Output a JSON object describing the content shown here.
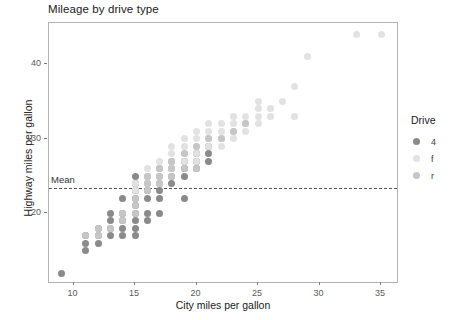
{
  "chart_data": {
    "type": "scatter",
    "title": "Mileage by drive type",
    "xlabel": "City miles per gallon",
    "ylabel": "Highway miles per gallon",
    "xlim": [
      8.0,
      36.3
    ],
    "ylim": [
      10.8,
      45.5
    ],
    "xticks": [
      10,
      15,
      20,
      25,
      30,
      35
    ],
    "yticks": [
      20,
      30,
      40
    ],
    "grid": false,
    "legend": {
      "title": "Drive",
      "position": "right",
      "entries": [
        {
          "label": "4",
          "color": "#8a8a8a"
        },
        {
          "label": "f",
          "color": "#e2e2e2"
        },
        {
          "label": "r",
          "color": "#c6c6c6"
        }
      ]
    },
    "annotations": [
      {
        "label": "Mean",
        "type": "hline",
        "y": 23.44,
        "style": "dashed",
        "color": "#555555"
      }
    ],
    "series": [
      {
        "name": "4",
        "color": "#8a8a8a",
        "points": [
          [
            9,
            12
          ],
          [
            11,
            15
          ],
          [
            11,
            16
          ],
          [
            11,
            17
          ],
          [
            12,
            16
          ],
          [
            12,
            17
          ],
          [
            12,
            18
          ],
          [
            13,
            17
          ],
          [
            13,
            18
          ],
          [
            13,
            19
          ],
          [
            13,
            20
          ],
          [
            14,
            17
          ],
          [
            14,
            18
          ],
          [
            14,
            19
          ],
          [
            14,
            20
          ],
          [
            14,
            22
          ],
          [
            15,
            17
          ],
          [
            15,
            18
          ],
          [
            15,
            19
          ],
          [
            15,
            20
          ],
          [
            15,
            21
          ],
          [
            15,
            22
          ],
          [
            15,
            23
          ],
          [
            15,
            24
          ],
          [
            15,
            25
          ],
          [
            16,
            19
          ],
          [
            16,
            20
          ],
          [
            16,
            22
          ],
          [
            16,
            23
          ],
          [
            16,
            24
          ],
          [
            16,
            25
          ],
          [
            17,
            20
          ],
          [
            17,
            22
          ],
          [
            17,
            23
          ],
          [
            17,
            24
          ],
          [
            17,
            25
          ],
          [
            17,
            26
          ],
          [
            18,
            24
          ],
          [
            18,
            25
          ],
          [
            18,
            26
          ],
          [
            18,
            27
          ],
          [
            19,
            22
          ],
          [
            19,
            25
          ],
          [
            19,
            26
          ],
          [
            19,
            27
          ],
          [
            20,
            26
          ],
          [
            20,
            27
          ],
          [
            20,
            28
          ],
          [
            21,
            27
          ],
          [
            21,
            28
          ],
          [
            21,
            29
          ]
        ]
      },
      {
        "name": "f",
        "color": "#e2e2e2",
        "points": [
          [
            15,
            23
          ],
          [
            15,
            24
          ],
          [
            16,
            24
          ],
          [
            16,
            25
          ],
          [
            16,
            26
          ],
          [
            17,
            24
          ],
          [
            17,
            25
          ],
          [
            17,
            26
          ],
          [
            17,
            27
          ],
          [
            18,
            26
          ],
          [
            18,
            27
          ],
          [
            18,
            28
          ],
          [
            18,
            29
          ],
          [
            19,
            27
          ],
          [
            19,
            28
          ],
          [
            19,
            29
          ],
          [
            19,
            30
          ],
          [
            20,
            27
          ],
          [
            20,
            28
          ],
          [
            20,
            29
          ],
          [
            20,
            30
          ],
          [
            20,
            31
          ],
          [
            21,
            29
          ],
          [
            21,
            30
          ],
          [
            21,
            31
          ],
          [
            21,
            32
          ],
          [
            22,
            29
          ],
          [
            22,
            30
          ],
          [
            22,
            31
          ],
          [
            22,
            32
          ],
          [
            23,
            30
          ],
          [
            23,
            31
          ],
          [
            23,
            32
          ],
          [
            23,
            33
          ],
          [
            24,
            31
          ],
          [
            24,
            32
          ],
          [
            24,
            33
          ],
          [
            25,
            32
          ],
          [
            25,
            33
          ],
          [
            25,
            34
          ],
          [
            25,
            35
          ],
          [
            26,
            33
          ],
          [
            26,
            34
          ],
          [
            27,
            35
          ],
          [
            28,
            33
          ],
          [
            28,
            37
          ],
          [
            29,
            41
          ],
          [
            33,
            44
          ],
          [
            35,
            44
          ]
        ]
      },
      {
        "name": "r",
        "color": "#c6c6c6",
        "points": [
          [
            11,
            17
          ],
          [
            12,
            17
          ],
          [
            12,
            18
          ],
          [
            13,
            18
          ],
          [
            14,
            19
          ],
          [
            14,
            20
          ],
          [
            15,
            20
          ],
          [
            15,
            21
          ],
          [
            15,
            22
          ],
          [
            16,
            23
          ],
          [
            16,
            24
          ],
          [
            16,
            25
          ],
          [
            17,
            24
          ],
          [
            17,
            25
          ],
          [
            17,
            26
          ],
          [
            18,
            25
          ],
          [
            18,
            26
          ],
          [
            18,
            27
          ],
          [
            19,
            26
          ],
          [
            19,
            28
          ],
          [
            20,
            26
          ],
          [
            20,
            29
          ],
          [
            21,
            30
          ],
          [
            22,
            30
          ],
          [
            23,
            31
          ],
          [
            24,
            32
          ]
        ]
      }
    ]
  }
}
